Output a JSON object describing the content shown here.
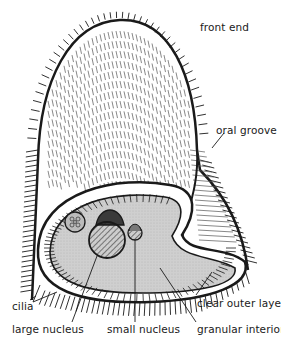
{
  "figure": {
    "labels": {
      "front_end": "front end",
      "oral_groove": "oral groove",
      "cilia": "cilia",
      "clear_outer_layer": "clear outer layer",
      "large_nucleus": "large nucleus",
      "small_nucleus": "small nucleus",
      "granular_interior": "granular interior"
    },
    "caption": "Fig. 1 — A protozoan (partially cut off)"
  },
  "colors": {
    "ink": "#1a1a1a",
    "interior_fill": "#cfcfcf",
    "background": "#ffffff"
  }
}
